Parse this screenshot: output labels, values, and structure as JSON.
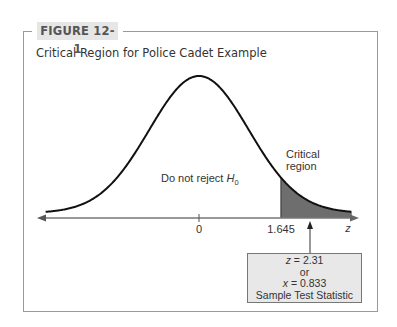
{
  "figure": {
    "label": "FIGURE 12-1",
    "title": "Critical Region for Police Cadet Example"
  },
  "annotations": {
    "do_not_reject_prefix": "Do not reject ",
    "do_not_reject_var": "H",
    "do_not_reject_sub": "0",
    "critical_line1": "Critical",
    "critical_line2": "region",
    "tick_zero": "0",
    "tick_critical": "1.645",
    "axis_var": "z"
  },
  "test_statistic_box": {
    "z_var": "z",
    "z_value": " = 2.31",
    "or": "or",
    "x_var": "x",
    "x_value": " = 0.833",
    "caption": "Sample Test Statistic"
  },
  "colors": {
    "curve": "#111111",
    "axis": "#777777",
    "critical_fill": "#6e6e6e",
    "badge_bg": "#e6e6e6",
    "box_bg": "#e8e8e8"
  },
  "chart_data": {
    "type": "area",
    "title": "Critical Region for Police Cadet Example",
    "distribution": "standard normal",
    "xlabel": "z",
    "ylabel": "",
    "x_range": [
      -3.1,
      3.2
    ],
    "ticks": [
      {
        "value": 0,
        "label": "0"
      },
      {
        "value": 1.645,
        "label": "1.645"
      }
    ],
    "critical_value": 1.645,
    "tail": "right",
    "regions": [
      {
        "name": "Do not reject H0",
        "from": -3.1,
        "to": 1.645,
        "shaded": false
      },
      {
        "name": "Critical region",
        "from": 1.645,
        "to": 3.1,
        "shaded": true
      }
    ],
    "test_statistic": {
      "z": 2.31,
      "x": 0.833,
      "label": "Sample Test Statistic"
    },
    "grid": false,
    "legend": "none"
  }
}
